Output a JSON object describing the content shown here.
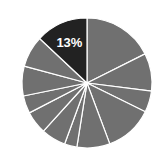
{
  "chart_data": {
    "type": "pie",
    "title": "",
    "start_angle_deg": 0,
    "direction": "clockwise",
    "center": [
      87,
      83
    ],
    "radius": 65,
    "colors": {
      "default": "#707070",
      "highlight": "#222222",
      "separator": "#ffffff",
      "label": "#ffffff"
    },
    "slices": [
      {
        "value": 17.6,
        "highlight": false,
        "label": ""
      },
      {
        "value": 9.4,
        "highlight": false,
        "label": ""
      },
      {
        "value": 5.3,
        "highlight": false,
        "label": ""
      },
      {
        "value": 12.0,
        "highlight": false,
        "label": ""
      },
      {
        "value": 8.2,
        "highlight": false,
        "label": ""
      },
      {
        "value": 3.1,
        "highlight": false,
        "label": ""
      },
      {
        "value": 6.1,
        "highlight": false,
        "label": ""
      },
      {
        "value": 5.7,
        "highlight": false,
        "label": ""
      },
      {
        "value": 4.4,
        "highlight": false,
        "label": ""
      },
      {
        "value": 7.4,
        "highlight": false,
        "label": ""
      },
      {
        "value": 7.8,
        "highlight": false,
        "label": ""
      },
      {
        "value": 13.0,
        "highlight": true,
        "label": "13%"
      }
    ],
    "legend": null,
    "grid": false
  }
}
